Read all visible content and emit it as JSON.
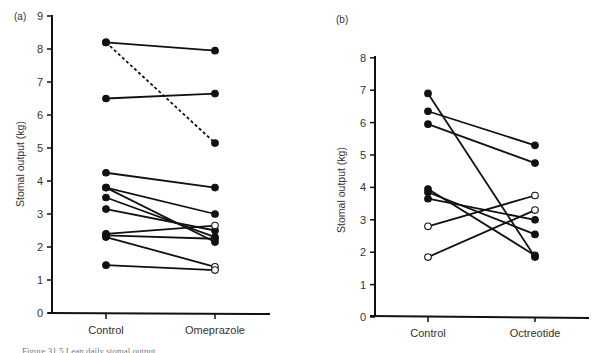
{
  "chart_data": [
    {
      "panel": "(a)",
      "type": "line",
      "subtype": "paired-slopegraph",
      "title": "",
      "xlabel": "",
      "ylabel": "Stomal output (kg)",
      "categories": [
        "Control",
        "Omeprazole"
      ],
      "ylim": [
        0,
        9
      ],
      "yticks": [
        0,
        1,
        2,
        3,
        4,
        5,
        6,
        7,
        8,
        9
      ],
      "grid": false,
      "legend": null,
      "series": [
        {
          "name": "patient-1",
          "values": [
            8.2,
            7.95
          ],
          "markers": [
            "filled",
            "filled"
          ],
          "style": "solid"
        },
        {
          "name": "patient-2",
          "values": [
            8.2,
            5.15
          ],
          "markers": [
            "filled",
            "filled"
          ],
          "style": "dashed"
        },
        {
          "name": "patient-3",
          "values": [
            6.5,
            6.65
          ],
          "markers": [
            "filled",
            "filled"
          ],
          "style": "solid"
        },
        {
          "name": "patient-4",
          "values": [
            4.25,
            3.8
          ],
          "markers": [
            "filled",
            "filled"
          ],
          "style": "solid"
        },
        {
          "name": "patient-5",
          "values": [
            3.8,
            3.0
          ],
          "markers": [
            "filled",
            "filled"
          ],
          "style": "solid"
        },
        {
          "name": "patient-6",
          "values": [
            3.8,
            2.15
          ],
          "markers": [
            "filled",
            "filled"
          ],
          "style": "solid"
        },
        {
          "name": "patient-7",
          "values": [
            3.5,
            2.3
          ],
          "markers": [
            "filled",
            "filled"
          ],
          "style": "solid"
        },
        {
          "name": "patient-8",
          "values": [
            3.15,
            2.5
          ],
          "markers": [
            "filled",
            "filled"
          ],
          "style": "solid"
        },
        {
          "name": "patient-9",
          "values": [
            2.4,
            2.65
          ],
          "markers": [
            "filled",
            "open"
          ],
          "style": "solid"
        },
        {
          "name": "patient-10",
          "values": [
            2.35,
            2.25
          ],
          "markers": [
            "filled",
            "filled"
          ],
          "style": "solid"
        },
        {
          "name": "patient-11",
          "values": [
            2.3,
            1.4
          ],
          "markers": [
            "filled",
            "open"
          ],
          "style": "solid"
        },
        {
          "name": "patient-12",
          "values": [
            1.45,
            1.3
          ],
          "markers": [
            "filled",
            "open"
          ],
          "style": "solid"
        }
      ]
    },
    {
      "panel": "(b)",
      "type": "line",
      "subtype": "paired-slopegraph",
      "title": "",
      "xlabel": "",
      "ylabel": "Stomal output (kg)",
      "categories": [
        "Control",
        "Octreotide"
      ],
      "ylim": [
        0,
        8
      ],
      "yticks": [
        0,
        1,
        2,
        3,
        4,
        5,
        6,
        7,
        8
      ],
      "grid": false,
      "legend": null,
      "series": [
        {
          "name": "patient-1",
          "values": [
            6.9,
            1.85
          ],
          "markers": [
            "filled",
            "filled"
          ],
          "style": "solid"
        },
        {
          "name": "patient-2",
          "values": [
            6.35,
            5.3
          ],
          "markers": [
            "filled",
            "filled"
          ],
          "style": "solid"
        },
        {
          "name": "patient-3",
          "values": [
            5.95,
            4.75
          ],
          "markers": [
            "filled",
            "filled"
          ],
          "style": "solid"
        },
        {
          "name": "patient-4",
          "values": [
            3.95,
            1.9
          ],
          "markers": [
            "filled",
            "filled"
          ],
          "style": "solid"
        },
        {
          "name": "patient-5",
          "values": [
            3.85,
            2.55
          ],
          "markers": [
            "filled",
            "filled"
          ],
          "style": "solid"
        },
        {
          "name": "patient-6",
          "values": [
            3.65,
            3.0
          ],
          "markers": [
            "filled",
            "filled"
          ],
          "style": "solid"
        },
        {
          "name": "patient-7",
          "values": [
            2.8,
            3.75
          ],
          "markers": [
            "open",
            "open"
          ],
          "style": "solid"
        },
        {
          "name": "patient-8",
          "values": [
            1.85,
            3.3
          ],
          "markers": [
            "open",
            "open"
          ],
          "style": "solid"
        }
      ]
    }
  ],
  "caption_partial": "Figure 31.5  Lean daily stomal output...",
  "colors": {
    "ink": "#111111",
    "label": "#333333",
    "background": "#ffffff"
  }
}
